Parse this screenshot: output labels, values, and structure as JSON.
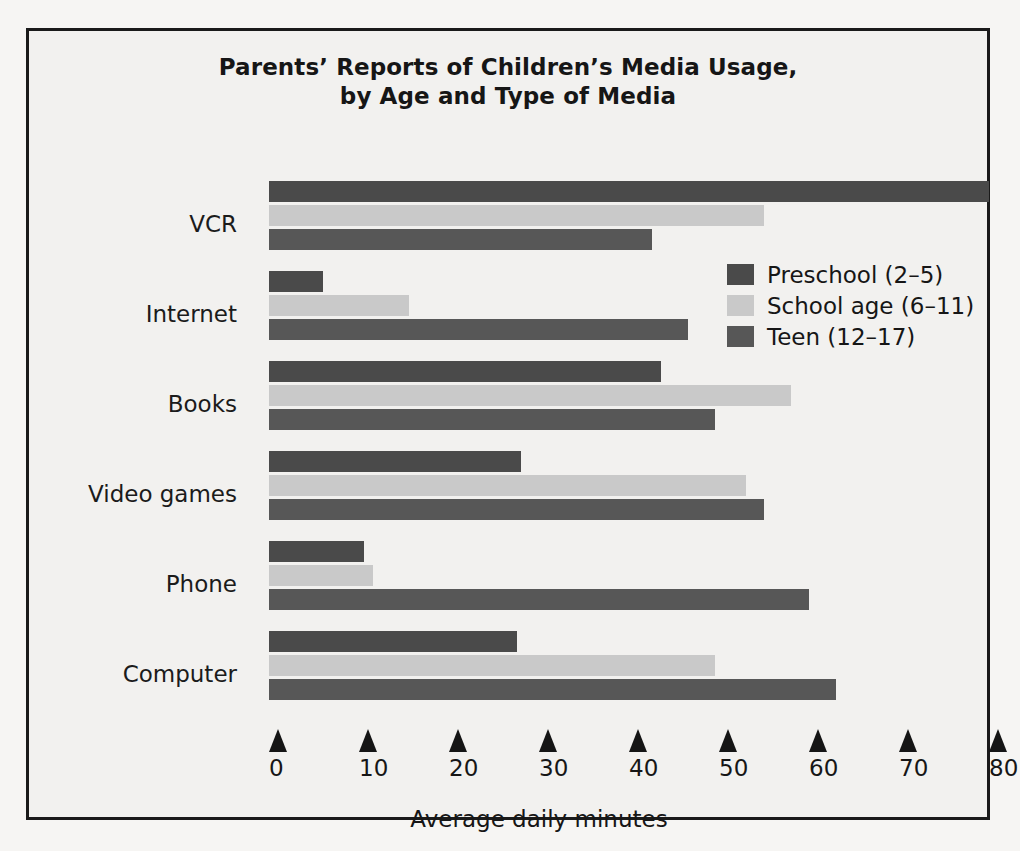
{
  "chart_data": {
    "type": "bar",
    "orientation": "horizontal",
    "title_lines": [
      "Parents’ Reports of Children’s Media Usage,",
      "by Age and Type of Media"
    ],
    "xlabel": "Average daily minutes",
    "ylabel": "",
    "xlim": [
      0,
      80
    ],
    "xticks": [
      0,
      10,
      20,
      30,
      40,
      50,
      60,
      70,
      80
    ],
    "xtick_labels": [
      "0",
      "10",
      "20",
      "30",
      "40",
      "50",
      "60",
      "70",
      "80"
    ],
    "grid": false,
    "legend_position": "inside-upper-right",
    "categories": [
      "VCR",
      "Internet",
      "Books",
      "Video games",
      "Phone",
      "Computer"
    ],
    "series": [
      {
        "name": "Preschool (2–5)",
        "color": "#4a4a4a",
        "values": [
          80,
          6,
          43.5,
          28,
          10.5,
          27.5
        ]
      },
      {
        "name": "School age (6–11)",
        "color": "#c9c9c9",
        "values": [
          55,
          15.5,
          58,
          53,
          11.5,
          49.5
        ]
      },
      {
        "name": "Teen (12–17)",
        "color": "#575757",
        "values": [
          42.5,
          46.5,
          49.5,
          55,
          60,
          63
        ]
      }
    ]
  },
  "colors": {
    "frame": "#1a1a1a",
    "background": "#f2f1ef",
    "text": "#161616",
    "preschool": "#4a4a4a",
    "school_age": "#c9c9c9",
    "teen": "#575757"
  }
}
